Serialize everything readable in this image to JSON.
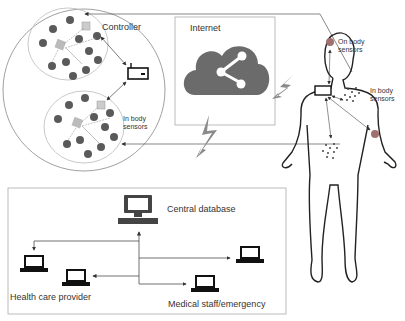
{
  "labels": {
    "controller": "Controller",
    "internet": "Internet",
    "in_body_sensors_cluster": [
      "In body",
      "sensors"
    ],
    "on_body_sensors": [
      "On body",
      "sensors"
    ],
    "in_body_sensors_human": [
      "In body",
      "sensors"
    ],
    "central_database": "Central database",
    "health_care_provider": "Health care provider",
    "medical_staff": "Medical  staff/emergency"
  },
  "colors": {
    "sensor_dot": "#5a5a5a",
    "cloud": "#6b6b6b",
    "lightning": "#8a8a8a",
    "on_body_sensor": "#a07070",
    "outline": "#222222",
    "frame": "#999999"
  },
  "icons": {
    "cloud": "cloud-share-icon",
    "controller": "controller-cube-icon",
    "gateway": "gateway-device-icon",
    "database": "desktop-computer-icon",
    "laptop": "laptop-icon",
    "lightning": "wireless-lightning-icon"
  }
}
